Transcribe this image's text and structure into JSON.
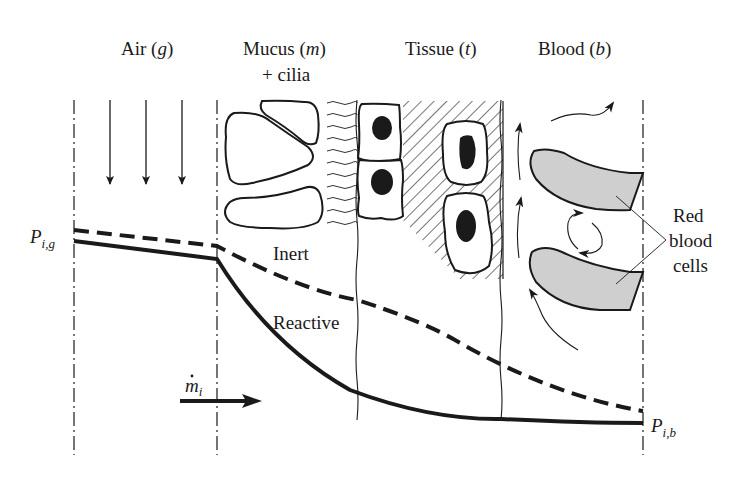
{
  "diagram": {
    "type": "mass-transfer-schematic",
    "regions": [
      {
        "id": "air",
        "label": "Air (",
        "symbol": "g",
        "close": ")"
      },
      {
        "id": "mucus",
        "label": "Mucus (",
        "symbol": "m",
        "close": ")",
        "sublabel": "+ cilia"
      },
      {
        "id": "tissue",
        "label": "Tissue (",
        "symbol": "t",
        "close": ")"
      },
      {
        "id": "blood",
        "label": "Blood (",
        "symbol": "b",
        "close": ")"
      }
    ],
    "curves": {
      "inert_label": "Inert",
      "reactive_label": "Reactive"
    },
    "boundaries": {
      "left_label_main": "P",
      "left_label_sub": "i,g",
      "right_label_main": "P",
      "right_label_sub": "i,b"
    },
    "flux": {
      "label_main": "m",
      "label_sub": "i"
    },
    "annotation": {
      "line1": "Red",
      "line2": "blood",
      "line3": "cells"
    },
    "colors": {
      "ink": "#1a1a1a",
      "rbc_fill": "#cfcfcf",
      "background": "#ffffff"
    }
  }
}
